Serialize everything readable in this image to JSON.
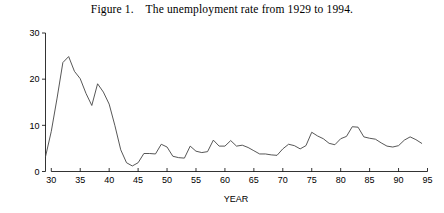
{
  "figure": {
    "title": "Figure 1.    The unemployment rate from 1929 to 1994."
  },
  "chart_data": {
    "type": "line",
    "title": "Figure 1.    The unemployment rate from 1929 to 1994.",
    "xlabel": "YEAR",
    "ylabel": "",
    "xlim": [
      29,
      95
    ],
    "ylim": [
      0,
      30
    ],
    "xticks": [
      30,
      35,
      40,
      45,
      50,
      55,
      60,
      65,
      70,
      75,
      80,
      85,
      90,
      95
    ],
    "xtick_labels": [
      "30",
      "35",
      "40",
      "45",
      "50",
      "55",
      "60",
      "65",
      "70",
      "75",
      "80",
      "85",
      "90",
      "95"
    ],
    "yticks": [
      0,
      10,
      20,
      30
    ],
    "ytick_labels": [
      "0",
      "10",
      "20",
      "30"
    ],
    "grid": false,
    "legend": null,
    "line_color": "#444444",
    "x": [
      29,
      30,
      31,
      32,
      33,
      34,
      35,
      36,
      37,
      38,
      39,
      40,
      41,
      42,
      43,
      44,
      45,
      46,
      47,
      48,
      49,
      50,
      51,
      52,
      53,
      54,
      55,
      56,
      57,
      58,
      59,
      60,
      61,
      62,
      63,
      64,
      65,
      66,
      67,
      68,
      69,
      70,
      71,
      72,
      73,
      74,
      75,
      76,
      77,
      78,
      79,
      80,
      81,
      82,
      83,
      84,
      85,
      86,
      87,
      88,
      89,
      90,
      91,
      92,
      93,
      94
    ],
    "values": [
      3.2,
      8.7,
      15.9,
      23.6,
      24.9,
      21.7,
      20.1,
      16.9,
      14.3,
      19.0,
      17.2,
      14.6,
      9.9,
      4.7,
      1.9,
      1.2,
      1.9,
      3.9,
      3.9,
      3.8,
      5.9,
      5.3,
      3.3,
      3.0,
      2.9,
      5.5,
      4.4,
      4.1,
      4.3,
      6.8,
      5.5,
      5.5,
      6.7,
      5.5,
      5.7,
      5.2,
      4.5,
      3.8,
      3.8,
      3.6,
      3.5,
      4.9,
      5.9,
      5.6,
      4.9,
      5.6,
      8.5,
      7.7,
      7.1,
      6.1,
      5.8,
      7.1,
      7.6,
      9.7,
      9.6,
      7.5,
      7.2,
      7.0,
      6.2,
      5.5,
      5.3,
      5.6,
      6.8,
      7.5,
      6.9,
      6.1
    ],
    "series": [
      {
        "name": "Unemployment rate",
        "values": [
          3.2,
          8.7,
          15.9,
          23.6,
          24.9,
          21.7,
          20.1,
          16.9,
          14.3,
          19.0,
          17.2,
          14.6,
          9.9,
          4.7,
          1.9,
          1.2,
          1.9,
          3.9,
          3.9,
          3.8,
          5.9,
          5.3,
          3.3,
          3.0,
          2.9,
          5.5,
          4.4,
          4.1,
          4.3,
          6.8,
          5.5,
          5.5,
          6.7,
          5.5,
          5.7,
          5.2,
          4.5,
          3.8,
          3.8,
          3.6,
          3.5,
          4.9,
          5.9,
          5.6,
          4.9,
          5.6,
          8.5,
          7.7,
          7.1,
          6.1,
          5.8,
          7.1,
          7.6,
          9.7,
          9.6,
          7.5,
          7.2,
          7.0,
          6.2,
          5.5,
          5.3,
          5.6,
          6.8,
          7.5,
          6.9,
          6.1
        ]
      }
    ]
  }
}
